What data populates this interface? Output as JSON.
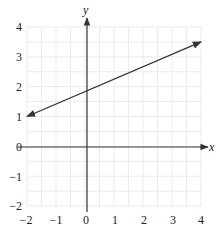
{
  "chart_data": {
    "type": "line",
    "title": "",
    "xlabel": "x",
    "ylabel": "y",
    "xlim": [
      -2,
      4
    ],
    "ylim": [
      -2,
      4
    ],
    "grid": true,
    "grid_minor_step": 0.5,
    "x_ticks": [
      "-2",
      "-1",
      "0",
      "1",
      "2",
      "3",
      "4"
    ],
    "y_ticks": [
      "4",
      "3",
      "2",
      "1",
      "0",
      "-1",
      "-2"
    ],
    "series": [
      {
        "name": "line",
        "x": [
          -2,
          4
        ],
        "y": [
          1,
          3.5
        ],
        "arrows_both_ends": true,
        "color": "#333333"
      }
    ]
  },
  "labels": {
    "x_axis": "x",
    "y_axis": "y",
    "x_ticks": [
      "−2",
      "−1",
      "0",
      "1",
      "2",
      "3",
      "4"
    ],
    "y_ticks": [
      "4",
      "3",
      "2",
      "1",
      "0",
      "−1",
      "−2"
    ]
  }
}
